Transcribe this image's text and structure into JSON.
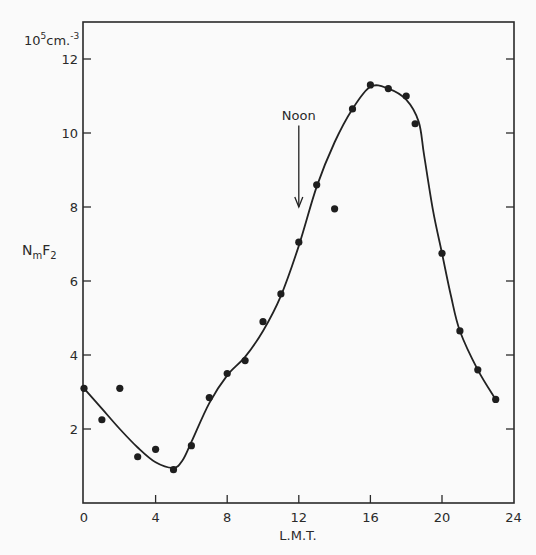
{
  "chart_data": {
    "type": "line",
    "title": "",
    "xlabel": "L.M.T.",
    "ylabel": "NmF2",
    "ylabel_main": "N",
    "ylabel_sub_m": "m",
    "ylabel_F": "F",
    "ylabel_sub_2": "2",
    "y_unit": "10^5 cm.^-3",
    "y_unit_base": "10",
    "y_unit_exp": "5",
    "y_unit_rest": "cm.",
    "y_unit_rest_exp": "-3",
    "xlim": [
      0,
      24
    ],
    "ylim": [
      0,
      13
    ],
    "x_ticks": [
      0,
      4,
      8,
      12,
      16,
      20,
      24
    ],
    "y_ticks": [
      2,
      4,
      6,
      8,
      10,
      12
    ],
    "grid": false,
    "annotation": {
      "text": "Noon",
      "x": 12,
      "arrow_from_y": 10.2,
      "arrow_to_y": 8.0
    },
    "series": [
      {
        "name": "observed",
        "kind": "scatter",
        "points": [
          [
            0,
            3.1
          ],
          [
            1,
            2.25
          ],
          [
            2,
            3.1
          ],
          [
            3,
            1.25
          ],
          [
            4,
            1.45
          ],
          [
            5,
            0.9
          ],
          [
            6,
            1.55
          ],
          [
            7,
            2.85
          ],
          [
            8,
            3.5
          ],
          [
            9,
            3.85
          ],
          [
            10,
            4.9
          ],
          [
            11,
            5.65
          ],
          [
            12,
            7.05
          ],
          [
            13,
            8.6
          ],
          [
            14,
            7.95
          ],
          [
            15,
            10.65
          ],
          [
            16,
            11.3
          ],
          [
            17,
            11.2
          ],
          [
            18,
            11.0
          ],
          [
            18.5,
            10.25
          ],
          [
            20,
            6.75
          ],
          [
            21,
            4.65
          ],
          [
            22,
            3.6
          ],
          [
            23,
            2.8
          ]
        ]
      },
      {
        "name": "fitted curve",
        "kind": "line",
        "points": [
          [
            0,
            3.1
          ],
          [
            1,
            2.55
          ],
          [
            2,
            2.0
          ],
          [
            3,
            1.5
          ],
          [
            4,
            1.1
          ],
          [
            5,
            0.95
          ],
          [
            5.5,
            1.15
          ],
          [
            6,
            1.65
          ],
          [
            7,
            2.7
          ],
          [
            8,
            3.45
          ],
          [
            9,
            3.95
          ],
          [
            10,
            4.65
          ],
          [
            11,
            5.6
          ],
          [
            12,
            6.95
          ],
          [
            13,
            8.55
          ],
          [
            14,
            9.75
          ],
          [
            15,
            10.65
          ],
          [
            16,
            11.25
          ],
          [
            17,
            11.2
          ],
          [
            18,
            10.9
          ],
          [
            18.7,
            10.3
          ],
          [
            19,
            9.4
          ],
          [
            19.5,
            7.9
          ],
          [
            20,
            6.75
          ],
          [
            20.5,
            5.6
          ],
          [
            21,
            4.65
          ],
          [
            22,
            3.6
          ],
          [
            23,
            2.8
          ]
        ]
      }
    ]
  }
}
